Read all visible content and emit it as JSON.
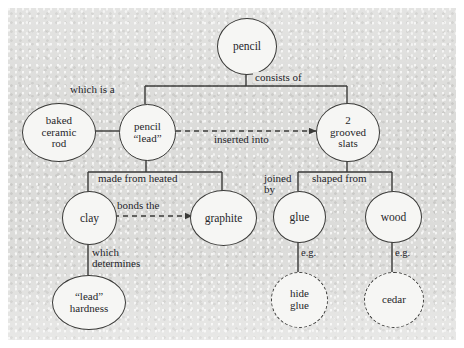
{
  "diagram": {
    "nodes": [
      {
        "id": "pencil",
        "label": "pencil",
        "style": "solid"
      },
      {
        "id": "rod",
        "label": "baked\nceramic\nrod",
        "style": "solid"
      },
      {
        "id": "lead",
        "label": "pencil\n“lead”",
        "style": "solid"
      },
      {
        "id": "slats",
        "label": "2\ngrooved\nslats",
        "style": "solid"
      },
      {
        "id": "clay",
        "label": "clay",
        "style": "solid"
      },
      {
        "id": "graphite",
        "label": "graphite",
        "style": "solid"
      },
      {
        "id": "glue",
        "label": "glue",
        "style": "solid"
      },
      {
        "id": "wood",
        "label": "wood",
        "style": "solid"
      },
      {
        "id": "hardness",
        "label": "“lead”\nhardness",
        "style": "solid"
      },
      {
        "id": "hideglue",
        "label": "hide\nglue",
        "style": "dashed"
      },
      {
        "id": "cedar",
        "label": "cedar",
        "style": "dashed"
      }
    ],
    "edge_labels": {
      "consists_of": "consists of",
      "which_is_a": "which is a",
      "inserted_into": "inserted into",
      "made_from_heated": "made from heated",
      "bonds_the": "bonds the",
      "which_determines": "which\ndetermines",
      "joined_by": "joined\nby",
      "shaped_from": "shaped from",
      "eg_glue": "e.g.",
      "eg_wood": "e.g."
    },
    "colors": {
      "background": "#dcdcda",
      "node_fill": "#f6f6f4",
      "stroke": "#3a3a38",
      "text": "#26262a"
    }
  }
}
